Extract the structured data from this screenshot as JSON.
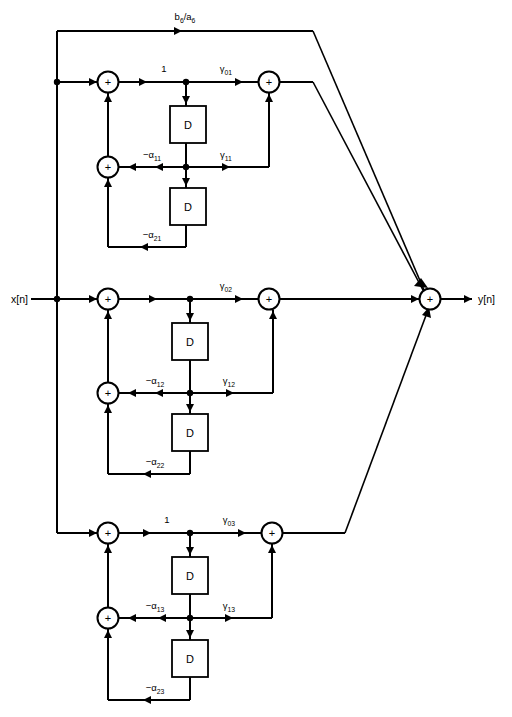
{
  "figure": {
    "type": "signal-flow-diagram",
    "width": 512,
    "height": 717,
    "background_color": "#ffffff",
    "line_color": "#000000"
  },
  "io": {
    "input_label": "x[n]",
    "output_label": "y[n]"
  },
  "global": {
    "feedforward_label_main": "b",
    "feedforward_label_sub1": "6",
    "feedforward_label_mid": "/a",
    "feedforward_label_sub2": "6",
    "feedforward_label_full": "b6/a6"
  },
  "adder_symbol": "+",
  "delay_symbol": "D",
  "sections": [
    {
      "id": "section-1",
      "index": 1,
      "input_gain_label": "1",
      "has_input_gain_label": true,
      "gamma0": {
        "base": "γ",
        "sub": "01",
        "full": "γ01"
      },
      "gamma1": {
        "base": "γ",
        "sub": "11",
        "full": "γ11"
      },
      "alpha1": {
        "base": "−α",
        "sub": "11",
        "full": "−α11"
      },
      "alpha2": {
        "base": "−α",
        "sub": "21",
        "full": "−α21"
      },
      "delay_blocks": [
        "D",
        "D"
      ],
      "adders": [
        "+",
        "+",
        "+"
      ]
    },
    {
      "id": "section-2",
      "index": 2,
      "input_gain_label": "",
      "has_input_gain_label": false,
      "gamma0": {
        "base": "γ",
        "sub": "02",
        "full": "γ02"
      },
      "gamma1": {
        "base": "γ",
        "sub": "12",
        "full": "γ12"
      },
      "alpha1": {
        "base": "−α",
        "sub": "12",
        "full": "−α12"
      },
      "alpha2": {
        "base": "−α",
        "sub": "22",
        "full": "−α22"
      },
      "delay_blocks": [
        "D",
        "D"
      ],
      "adders": [
        "+",
        "+",
        "+"
      ]
    },
    {
      "id": "section-3",
      "index": 3,
      "input_gain_label": "1",
      "has_input_gain_label": true,
      "gamma0": {
        "base": "γ",
        "sub": "03",
        "full": "γ03"
      },
      "gamma1": {
        "base": "γ",
        "sub": "13",
        "full": "γ13"
      },
      "alpha1": {
        "base": "−α",
        "sub": "13",
        "full": "−α13"
      },
      "alpha2": {
        "base": "−α",
        "sub": "23",
        "full": "−α23"
      },
      "delay_blocks": [
        "D",
        "D"
      ],
      "adders": [
        "+",
        "+",
        "+"
      ]
    }
  ],
  "output_adder": {
    "symbol": "+",
    "name": "summing-junction"
  }
}
